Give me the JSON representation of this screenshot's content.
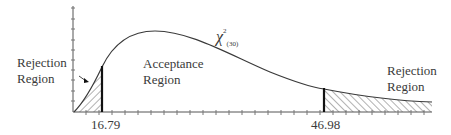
{
  "diagram": {
    "distribution": {
      "symbol": "χ",
      "superscript": "2",
      "subscript": "(30)"
    },
    "regions": {
      "left_rejection": {
        "line1": "Rejection",
        "line2": "Region"
      },
      "acceptance": {
        "line1": "Acceptance",
        "line2": "Region"
      },
      "right_rejection": {
        "line1": "Rejection",
        "line2": "Region"
      }
    },
    "critical_values": {
      "lower": "16.79",
      "upper": "46.98"
    },
    "colors": {
      "curve": "#3a3a3a",
      "hatch": "#555555",
      "critical_line": "#111111",
      "text": "#3a3a3a"
    }
  }
}
